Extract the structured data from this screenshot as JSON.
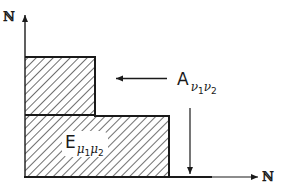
{
  "figure": {
    "type": "set-diagram",
    "axes": {
      "x_label": "ℕ",
      "y_label": "ℕ"
    },
    "regions": [
      {
        "id": "A",
        "label_main": "A",
        "subscripts": [
          {
            "symbol": "ν",
            "index": "1"
          },
          {
            "symbol": "ν",
            "index": "2"
          }
        ],
        "description": "hatched staircase region pointed to by arrow"
      },
      {
        "id": "E",
        "label_main": "E",
        "subscripts": [
          {
            "symbol": "μ",
            "index": "1"
          },
          {
            "symbol": "μ",
            "index": "2"
          }
        ],
        "description": "label inside lower hatched rectangle"
      }
    ],
    "arrows": [
      {
        "from": "A-label",
        "direction": "left",
        "target": "upper rectangle"
      },
      {
        "from": "A-label",
        "direction": "down",
        "target": "x-axis"
      }
    ],
    "colors": {
      "stroke": "#1a1a1a",
      "hatch": "#222222",
      "background": "#ffffff"
    }
  }
}
